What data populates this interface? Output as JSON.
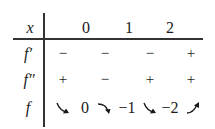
{
  "table": {
    "header": {
      "label": "x",
      "points": [
        "0",
        "1",
        "2"
      ]
    },
    "rows": [
      {
        "label": "f′",
        "signs": [
          "−",
          "−",
          "−",
          "+"
        ]
      },
      {
        "label": "f″",
        "signs": [
          "+",
          "−",
          "+",
          "+"
        ]
      },
      {
        "label": "f",
        "behavior": [
          {
            "type": "arrow",
            "direction": "decreasing",
            "concavity": "up",
            "icon": "arrow-down-right-convex-icon"
          },
          {
            "type": "value",
            "value": "0"
          },
          {
            "type": "arrow",
            "direction": "decreasing",
            "concavity": "down",
            "icon": "arrow-down-right-concave-icon"
          },
          {
            "type": "value",
            "value": "−1"
          },
          {
            "type": "arrow",
            "direction": "decreasing",
            "concavity": "up",
            "icon": "arrow-down-right-convex-icon"
          },
          {
            "type": "value",
            "value": "−2"
          },
          {
            "type": "arrow",
            "direction": "increasing",
            "concavity": "up",
            "icon": "arrow-up-right-convex-icon"
          }
        ],
        "values": [
          "0",
          "−1",
          "−2"
        ]
      }
    ]
  },
  "colors": {
    "ink": "#1a1a1a",
    "rule": "#333333",
    "background": "#ffffff"
  }
}
